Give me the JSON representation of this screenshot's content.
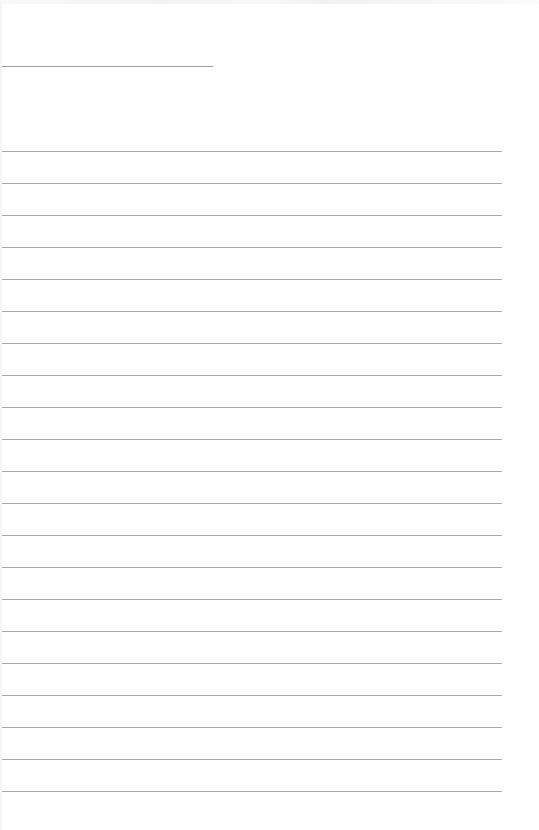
{
  "page": {
    "type": "lined-paper",
    "background": "#ffffff",
    "line_color": "#a8a8a8"
  },
  "header_line": {
    "top": 66,
    "left": 2,
    "width": 211
  },
  "rules": {
    "first_top": 151,
    "spacing": 32,
    "count": 21,
    "left": 2,
    "width": 500
  }
}
